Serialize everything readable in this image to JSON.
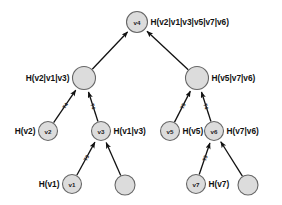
{
  "diagram": {
    "background_color": "#ffffff",
    "node_fill_color": "#dcdcdc",
    "node_stroke_color": "#666666",
    "edge_color": "#111111",
    "text_color": "#111111"
  },
  "nodes": [
    {
      "key": "v4",
      "id": "v4",
      "label": "H(v2|v1|v3|v5|v7|v6)",
      "label_side": "right",
      "cx": 137,
      "cy": 22,
      "r": 10.5
    },
    {
      "key": "n_l",
      "id": "",
      "label": "H(v2|v1|v3)",
      "label_side": "left",
      "cx": 84,
      "cy": 78,
      "r": 11.5
    },
    {
      "key": "n_r",
      "id": "",
      "label": "H(v5|v7|v6)",
      "label_side": "right",
      "cx": 197,
      "cy": 78,
      "r": 11.5
    },
    {
      "key": "v2",
      "id": "v2",
      "label": "H(v2)",
      "label_side": "left",
      "cx": 48,
      "cy": 131,
      "r": 9.5
    },
    {
      "key": "v3",
      "id": "v3",
      "label": "H(v1|v3)",
      "label_side": "right",
      "cx": 101,
      "cy": 131,
      "r": 9.5
    },
    {
      "key": "v5",
      "id": "v5",
      "label": "H(v5)",
      "label_side": "right",
      "cx": 170,
      "cy": 131,
      "r": 9.5
    },
    {
      "key": "v6",
      "id": "v6",
      "label": "H(v7|v6)",
      "label_side": "right",
      "cx": 214,
      "cy": 131,
      "r": 9.5
    },
    {
      "key": "v1",
      "id": "v1",
      "label": "H(v1)",
      "label_side": "left",
      "cx": 72,
      "cy": 184,
      "r": 9.5
    },
    {
      "key": "u1",
      "id": "",
      "label": "",
      "label_side": "none",
      "cx": 125,
      "cy": 185,
      "r": 10.0
    },
    {
      "key": "v7",
      "id": "v7",
      "label": "H(v7)",
      "label_side": "right",
      "cx": 196,
      "cy": 184,
      "r": 9.5
    },
    {
      "key": "u2",
      "id": "",
      "label": "",
      "label_side": "none",
      "cx": 248,
      "cy": 185,
      "r": 10.0
    }
  ],
  "edges": [
    {
      "from": "n_l",
      "to": "v4",
      "label": ""
    },
    {
      "from": "n_r",
      "to": "v4",
      "label": ""
    },
    {
      "from": "v2",
      "to": "n_l",
      "label": "T4"
    },
    {
      "from": "v3",
      "to": "n_l",
      "label": "T4"
    },
    {
      "from": "v5",
      "to": "n_r",
      "label": "T5"
    },
    {
      "from": "v6",
      "to": "n_r",
      "label": "T4"
    },
    {
      "from": "v1",
      "to": "v3",
      "label": "T3"
    },
    {
      "from": "u1",
      "to": "v3",
      "label": ""
    },
    {
      "from": "v7",
      "to": "v6",
      "label": "T3"
    },
    {
      "from": "u2",
      "to": "v6",
      "label": ""
    }
  ]
}
